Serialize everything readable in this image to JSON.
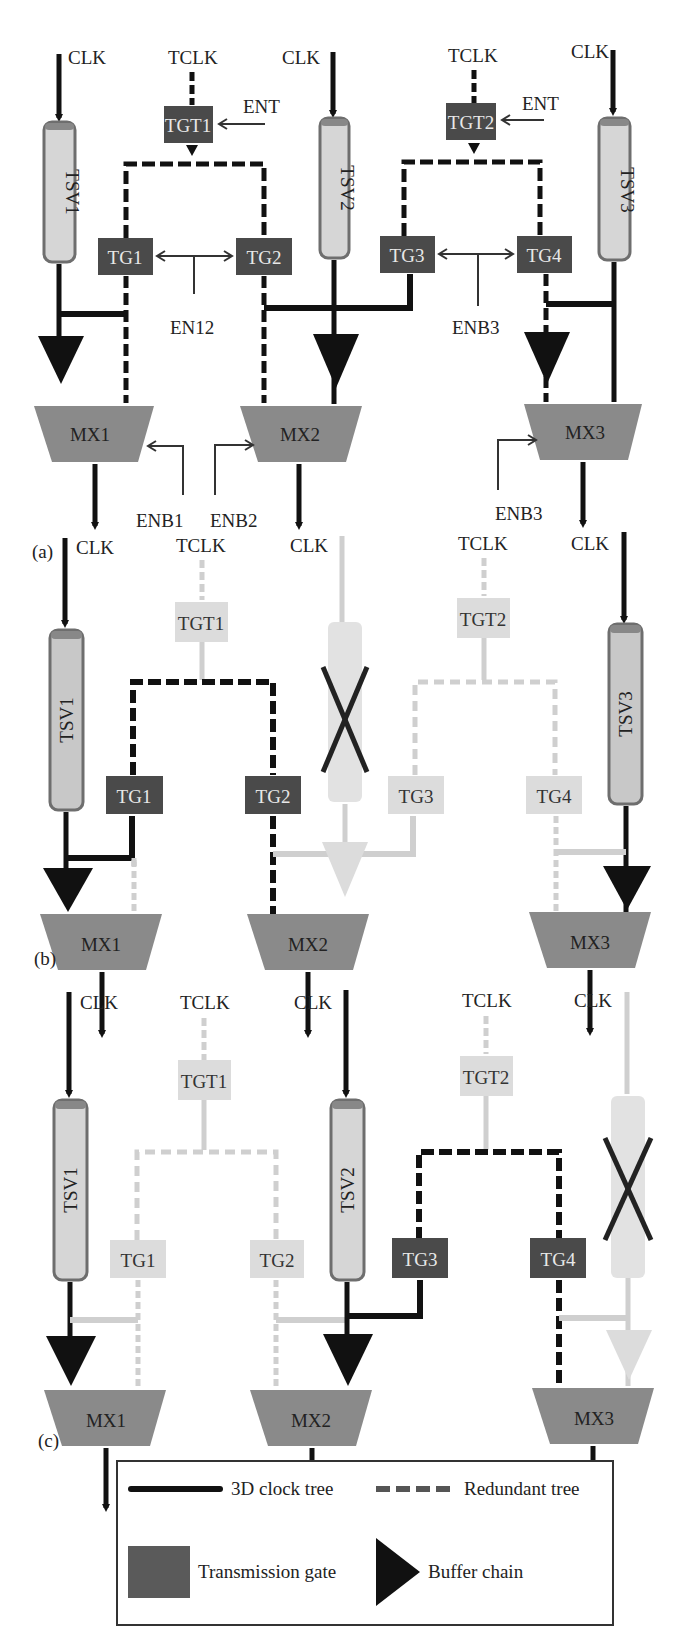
{
  "colors": {
    "active_line": "#111111",
    "faded_line": "#cfcfcf",
    "tg_active": "#4a4a4a",
    "tg_faded": "#dcdcdc",
    "tsv_fill": "#d6d6d6",
    "tsv_border": "#6e6e6e",
    "mux_fill": "#8a8a8a",
    "buffer": "#111111"
  },
  "panels": [
    {
      "label": "(a)",
      "clk_labels": [
        "CLK",
        "CLK",
        "CLK"
      ],
      "tclk_labels": [
        "TCLK",
        "TCLK"
      ],
      "tsv": [
        "TSV1",
        "TSV2",
        "TSV3"
      ],
      "tgt": [
        "TGT1",
        "TGT2"
      ],
      "tg": [
        "TG1",
        "TG2",
        "TG3",
        "TG4"
      ],
      "mux": [
        "MX1",
        "MX2",
        "MX3"
      ],
      "ent": [
        "ENT",
        "ENT"
      ],
      "en_mid": [
        "EN12",
        "ENB3"
      ],
      "enb": [
        "ENB1",
        "ENB2",
        "ENB3"
      ]
    },
    {
      "label": "(b)",
      "clk_labels": [
        "CLK",
        "CLK",
        "CLK"
      ],
      "tclk_labels": [
        "TCLK",
        "TCLK"
      ],
      "tsv": [
        "TSV1",
        "",
        "TSV3"
      ],
      "tgt": [
        "TGT1",
        "TGT2"
      ],
      "tg": [
        "TG1",
        "TG2",
        "TG3",
        "TG4"
      ],
      "mux": [
        "MX1",
        "MX2",
        "MX3"
      ],
      "failed_tsv": "TSV2"
    },
    {
      "label": "(c)",
      "clk_labels": [
        "CLK",
        "CLK",
        "CLK"
      ],
      "tclk_labels": [
        "TCLK",
        "TCLK"
      ],
      "tsv": [
        "TSV1",
        "TSV2",
        ""
      ],
      "tgt": [
        "TGT1",
        "TGT2"
      ],
      "tg": [
        "TG1",
        "TG2",
        "TG3",
        "TG4"
      ],
      "mux": [
        "MX1",
        "MX2",
        "MX3"
      ],
      "failed_tsv": "TSV3"
    }
  ],
  "legend": {
    "clock_tree": "3D clock tree",
    "redundant_tree": "Redundant tree",
    "transmission_gate": "Transmission gate",
    "buffer_chain": "Buffer chain"
  }
}
